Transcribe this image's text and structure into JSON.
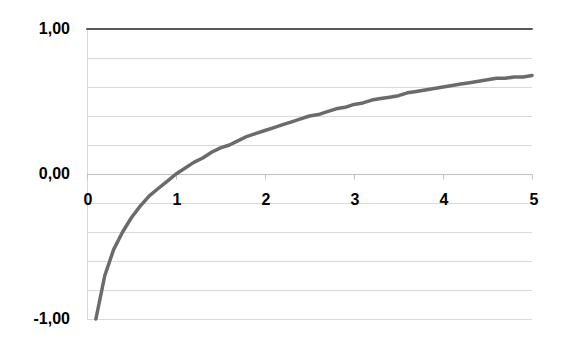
{
  "chart_data": {
    "type": "line",
    "title": "",
    "xlabel": "",
    "ylabel": "",
    "xlim": [
      0,
      5
    ],
    "ylim": [
      -1,
      1
    ],
    "grid": true,
    "grid_step_y": 0.2,
    "legend": "none",
    "x_tick_labels": [
      "0",
      "1",
      "2",
      "3",
      "4",
      "5"
    ],
    "x_ticks": [
      0,
      1,
      2,
      3,
      4,
      5
    ],
    "y_tick_labels": [
      "1,00",
      "0,00",
      "-1,00"
    ],
    "y_ticks": [
      1,
      0,
      -1
    ],
    "colors": {
      "gridline": "#d9d9d9",
      "axis": "#bfbfbf",
      "constant_series": "#595959",
      "curve_series": "#6b6b6b"
    },
    "series": [
      {
        "name": "y = 1",
        "x": [
          0,
          5
        ],
        "values": [
          1.0,
          1.0
        ]
      },
      {
        "name": "y = log10(x)",
        "x": [
          0.1,
          0.2,
          0.3,
          0.4,
          0.5,
          0.6,
          0.7,
          0.8,
          0.9,
          1.0,
          1.1,
          1.2,
          1.3,
          1.4,
          1.5,
          1.6,
          1.7,
          1.8,
          1.9,
          2.0,
          2.1,
          2.2,
          2.3,
          2.4,
          2.5,
          2.6,
          2.7,
          2.8,
          2.9,
          3.0,
          3.1,
          3.2,
          3.3,
          3.4,
          3.5,
          3.6,
          3.7,
          3.8,
          3.9,
          4.0,
          4.1,
          4.2,
          4.3,
          4.4,
          4.5,
          4.6,
          4.7,
          4.8,
          4.9,
          5.0
        ],
        "values": [
          -1.0,
          -0.7,
          -0.52,
          -0.4,
          -0.3,
          -0.22,
          -0.15,
          -0.1,
          -0.05,
          0.0,
          0.04,
          0.08,
          0.11,
          0.15,
          0.18,
          0.2,
          0.23,
          0.26,
          0.28,
          0.3,
          0.32,
          0.34,
          0.36,
          0.38,
          0.4,
          0.41,
          0.43,
          0.45,
          0.46,
          0.48,
          0.49,
          0.51,
          0.52,
          0.53,
          0.54,
          0.56,
          0.57,
          0.58,
          0.59,
          0.6,
          0.61,
          0.62,
          0.63,
          0.64,
          0.65,
          0.66,
          0.66,
          0.67,
          0.67,
          0.68
        ]
      }
    ]
  }
}
